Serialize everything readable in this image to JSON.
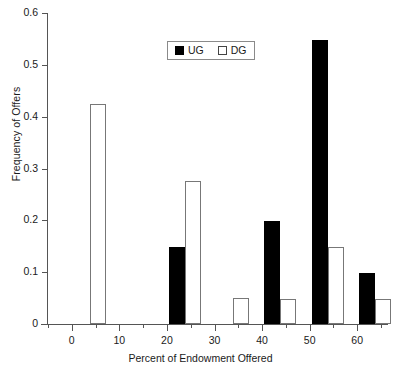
{
  "chart_data": {
    "type": "bar",
    "title": "",
    "xlabel": "Percent of Endowment Offered",
    "ylabel": "Frequency of Offers",
    "categories": [
      "0",
      "10",
      "20",
      "30",
      "40",
      "50",
      "60"
    ],
    "x": [
      0,
      10,
      20,
      30,
      40,
      50,
      60
    ],
    "series": [
      {
        "name": "UG",
        "color": "#000000",
        "fill": "solid",
        "values": [
          0,
          0,
          0.148,
          0,
          0.198,
          0.547,
          0.098
        ]
      },
      {
        "name": "DG",
        "color": "#ffffff",
        "fill": "open",
        "values": [
          0.425,
          0,
          0.275,
          0.05,
          0.048,
          0.148,
          0.048
        ]
      }
    ],
    "ylim": [
      0,
      0.6
    ],
    "xlim": [
      -5,
      65
    ],
    "ytick_labels": [
      "0",
      "0.1",
      "0.2",
      "0.3",
      "0.4",
      "0.5",
      "0.6"
    ],
    "yticks": [
      0,
      0.1,
      0.2,
      0.3,
      0.4,
      0.5,
      0.6
    ],
    "xtick_labels": [
      "0",
      "10",
      "20",
      "30",
      "40",
      "50",
      "60"
    ],
    "grid": false,
    "legend_position": "top-center",
    "legend_entries": [
      {
        "label": "UG",
        "swatch": "filled-black-square"
      },
      {
        "label": "DG",
        "swatch": "open-white-square"
      }
    ]
  },
  "axes": {
    "y_title": "Frequency of Offers",
    "x_title": "Percent of Endowment Offered"
  },
  "legend": {
    "ug_label": "UG",
    "dg_label": "DG"
  }
}
